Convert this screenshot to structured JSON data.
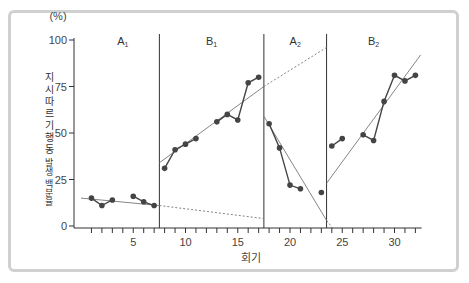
{
  "chart_data": {
    "type": "line",
    "title": "",
    "xlabel": "회기",
    "ylabel": "지시 따르기 행동 발생 백분율",
    "yunit": "(%)",
    "xlim": [
      0,
      33
    ],
    "ylim": [
      0,
      100
    ],
    "yticks": [
      0,
      25,
      50,
      75,
      100
    ],
    "xticks_labeled": [
      5,
      10,
      15,
      20,
      25,
      30
    ],
    "grid": false,
    "phases": [
      {
        "name": "A1",
        "base": "A",
        "sub": "1",
        "start": 0.5,
        "end": 7.5
      },
      {
        "name": "B1",
        "base": "B",
        "sub": "1",
        "start": 7.5,
        "end": 17.5
      },
      {
        "name": "A2",
        "base": "A",
        "sub": "2",
        "start": 17.5,
        "end": 23.5
      },
      {
        "name": "B2",
        "base": "B",
        "sub": "2",
        "start": 23.5,
        "end": 32.5
      }
    ],
    "series": [
      {
        "name": "A1",
        "segments": [
          [
            [
              1,
              15
            ],
            [
              2,
              11
            ],
            [
              3,
              14
            ]
          ],
          [
            [
              5,
              16
            ],
            [
              6,
              13
            ],
            [
              7,
              11
            ]
          ]
        ]
      },
      {
        "name": "B1",
        "segments": [
          [
            [
              8,
              31
            ],
            [
              9,
              41
            ],
            [
              10,
              44
            ],
            [
              11,
              47
            ]
          ],
          [
            [
              13,
              56
            ],
            [
              14,
              60
            ],
            [
              15,
              57
            ],
            [
              16,
              77
            ],
            [
              17,
              80
            ]
          ]
        ]
      },
      {
        "name": "A2",
        "segments": [
          [
            [
              18,
              55
            ],
            [
              19,
              42
            ],
            [
              20,
              22
            ],
            [
              21,
              20
            ]
          ],
          [
            [
              23,
              18
            ]
          ]
        ]
      },
      {
        "name": "B2",
        "segments": [
          [
            [
              24,
              43
            ],
            [
              25,
              47
            ]
          ],
          [
            [
              27,
              49
            ],
            [
              28,
              46
            ],
            [
              29,
              67
            ],
            [
              30,
              81
            ],
            [
              31,
              78
            ],
            [
              32,
              81
            ]
          ]
        ]
      }
    ],
    "trend_lines": [
      {
        "phase": "A1",
        "from": [
          0,
          15
        ],
        "to": [
          7.5,
          11
        ],
        "style": "solid"
      },
      {
        "phase": "A1-projection",
        "from": [
          7.5,
          11
        ],
        "to": [
          17.5,
          4
        ],
        "style": "dashed"
      },
      {
        "phase": "B1",
        "from": [
          7.5,
          34
        ],
        "to": [
          17.5,
          75
        ],
        "style": "solid"
      },
      {
        "phase": "B1-projection",
        "from": [
          17.5,
          75
        ],
        "to": [
          23.5,
          96
        ],
        "style": "dashed"
      },
      {
        "phase": "A2",
        "from": [
          17.5,
          59
        ],
        "to": [
          23.5,
          3
        ],
        "style": "solid"
      },
      {
        "phase": "A2-projection",
        "from": [
          23.5,
          3
        ],
        "to": [
          24.2,
          -2
        ],
        "style": "dashed"
      },
      {
        "phase": "B2",
        "from": [
          23.5,
          23
        ],
        "to": [
          32.5,
          92
        ],
        "style": "solid"
      }
    ]
  },
  "axis": {
    "y_unit": "(%)",
    "y_label_top": "지시 따르기 행동",
    "y_label_bottom": "발생 백분율",
    "x_label": "회기"
  }
}
